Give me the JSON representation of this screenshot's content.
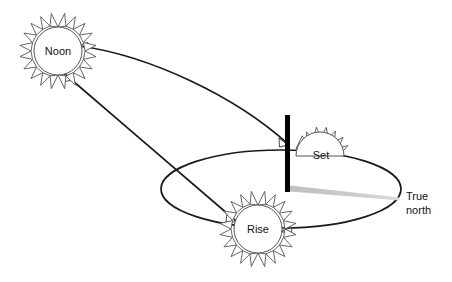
{
  "diagram": {
    "background_color": "#ffffff",
    "line_color": "#1a1a1a",
    "sun_outline_color": "#555555",
    "sun_fill_color": "#ffffff",
    "pole_color": "#000000",
    "shadow_color": "#c8c8c8",
    "text_color": "#111111"
  },
  "suns": [
    {
      "id": "noon",
      "label": "Noon",
      "shape": "full-sun",
      "cx": 58,
      "cy": 51,
      "radius": 24,
      "spikes": 16
    },
    {
      "id": "set",
      "label": "Set",
      "shape": "half-sun",
      "cx": 320,
      "cy": 155,
      "radius": 24,
      "spikes": 10
    },
    {
      "id": "rise",
      "label": "Rise",
      "shape": "full-sun",
      "cx": 258,
      "cy": 229,
      "radius": 24,
      "spikes": 16
    }
  ],
  "horizon": {
    "name": "horizon-ellipse",
    "cx": 281,
    "cy": 189,
    "rx": 120,
    "ry": 39
  },
  "gnomon": {
    "name": "gnomon-pole",
    "x": 287,
    "top_y": 115,
    "bottom_y": 191,
    "width": 5
  },
  "shadow": {
    "name": "gnomon-shadow",
    "from_x": 290,
    "from_y": 188,
    "to_x": 399,
    "to_y": 199,
    "thickness_near": 6,
    "thickness_far": 3
  },
  "labels": {
    "true_north_line1": "True",
    "true_north_line2": "north"
  },
  "paths": {
    "noon_to_set_arc": "Arc from Noon sun sweeping right and down to the Set sun at the gnomon",
    "noon_to_rise_arc": "Arc from Noon sun descending right to the Rise sun"
  }
}
